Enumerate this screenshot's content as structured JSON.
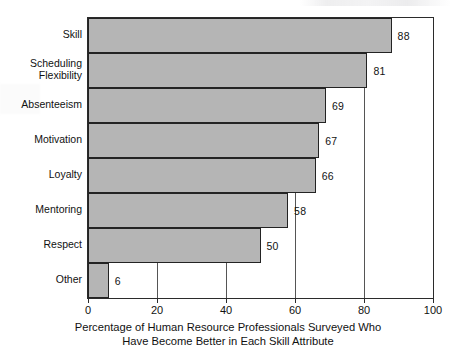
{
  "chart_data": {
    "type": "bar",
    "orientation": "horizontal",
    "title": "",
    "xlabel": "Percentage of Human Resource Professionals Surveyed Who Have Become Better in Each Skill Attribute",
    "xlabel_line1": "Percentage of Human Resource Professionals Surveyed Who",
    "xlabel_line2": "Have Become Better in Each Skill Attribute",
    "ylabel": "",
    "categories": [
      "Skill",
      "Scheduling\nFlexibility",
      "Absenteeism",
      "Motivation",
      "Loyalty",
      "Mentoring",
      "Respect",
      "Other"
    ],
    "values": [
      88,
      81,
      69,
      67,
      66,
      58,
      50,
      6
    ],
    "value_labels": [
      "88",
      "81",
      "69",
      "67",
      "66",
      "58",
      "50",
      "6"
    ],
    "xlim": [
      0,
      100
    ],
    "xticks": [
      0,
      20,
      40,
      60,
      80,
      100
    ],
    "xtick_labels": [
      "0",
      "20",
      "40",
      "60",
      "80",
      "100"
    ],
    "gridlines": [
      20,
      40,
      60,
      80
    ],
    "grid": true,
    "legend": false,
    "bar_color": "#b5b5b5",
    "bar_border_color": "#232323",
    "axis_color": "#2b2b2b",
    "grid_color": "#555555",
    "background": "#ffffff"
  }
}
